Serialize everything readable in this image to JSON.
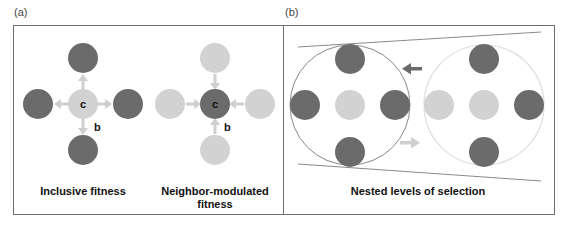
{
  "panels": {
    "a": {
      "label": "(a)",
      "left": {
        "caption": "Inclusive fitness",
        "center_label": "c",
        "benefit_label": "b"
      },
      "right": {
        "caption": "Neighbor-modulated fitness",
        "caption_line1": "Neighbor-modulated",
        "caption_line2": "fitness",
        "center_label": "c",
        "benefit_label": "b"
      }
    },
    "b": {
      "label": "(b)",
      "caption": "Nested levels of selection"
    }
  },
  "colors": {
    "dark": "#6b6b6b",
    "light": "#d2d2d2",
    "arrow_light": "#cfcfcf",
    "arrow_dark": "#6b6b6b",
    "border": "#6e6e6e",
    "outline_dark": "#888888",
    "outline_light": "#dddddd"
  }
}
